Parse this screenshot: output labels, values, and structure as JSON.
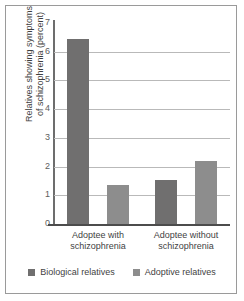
{
  "chart_data": {
    "type": "bar",
    "title": "",
    "xlabel": "",
    "ylabel": "Relatives showing symptoms of schizophrenia (percent)",
    "ylabel_lines": [
      "Relatives showing symptoms",
      "of schizophrenia (percent)"
    ],
    "ylim": [
      0,
      7
    ],
    "yticks": [
      0,
      1,
      2,
      3,
      4,
      5,
      6,
      7
    ],
    "ytick_labels": [
      "0",
      "1",
      "2",
      "3",
      "4",
      "5",
      "6",
      "7"
    ],
    "grid": true,
    "grid_axis": "y",
    "legend_position": "bottom",
    "categories": [
      "Adoptee with schizophrenia",
      "Adoptee without schizophrenia"
    ],
    "category_lines": [
      [
        "Adoptee with",
        "schizophrenia"
      ],
      [
        "Adoptee without",
        "schizophrenia"
      ]
    ],
    "series": [
      {
        "name": "Biological relatives",
        "color": "#706f6f",
        "values": [
          6.45,
          1.55
        ]
      },
      {
        "name": "Adoptive relatives",
        "color": "#8d8d8d",
        "values": [
          1.35,
          2.2
        ]
      }
    ]
  },
  "colors": {
    "biological": "#706f6f",
    "adoptive": "#8d8d8d",
    "grid": "#b9b9b9",
    "axis": "#4c4c4c",
    "border": "#9a9a9a",
    "text": "#3f3f3f"
  }
}
